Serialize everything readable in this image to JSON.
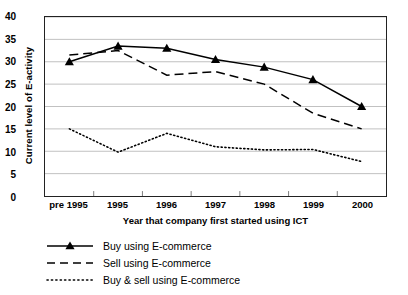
{
  "chart_data": {
    "type": "line",
    "title": "",
    "xlabel": "Year that company first started using ICT",
    "ylabel": "Current level of E-activity",
    "categories": [
      "pre 1995",
      "1995",
      "1996",
      "1997",
      "1998",
      "1999",
      "2000"
    ],
    "ylim": [
      0,
      40
    ],
    "yticks": [
      0,
      5,
      10,
      15,
      20,
      25,
      30,
      35,
      40
    ],
    "grid": true,
    "legend_position": "below-left",
    "series": [
      {
        "name": "Buy using E-commerce",
        "style": "solid-with-triangle-markers",
        "color": "#000000",
        "values": [
          30,
          33.5,
          33,
          30.5,
          28.8,
          26,
          20
        ]
      },
      {
        "name": "Sell using E-commerce",
        "style": "dashed",
        "color": "#000000",
        "values": [
          31.5,
          32.5,
          27,
          27.8,
          25,
          18.5,
          15
        ]
      },
      {
        "name": "Buy & sell using E-commerce",
        "style": "dotted",
        "color": "#000000",
        "values": [
          15,
          9.8,
          14,
          11,
          10.3,
          10.4,
          7.7
        ]
      }
    ]
  }
}
